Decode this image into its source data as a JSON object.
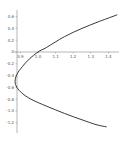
{
  "chart_data": {
    "type": "line",
    "title": "",
    "xlabel": "",
    "ylabel": "",
    "xlim": [
      0.85,
      1.47
    ],
    "ylim": [
      -1.3,
      0.7
    ],
    "grid": false,
    "legend": null,
    "x_ticks": [
      "0.9",
      "1.0",
      "1.1",
      "1.2",
      "1.3",
      "1.4"
    ],
    "y_ticks": [
      "0.6",
      "0.4",
      "0.2",
      "0",
      "-0.2",
      "-0.4",
      "-0.6",
      "-0.8",
      "-1.0",
      "-1.2"
    ],
    "series": [
      {
        "name": "curve",
        "color": "#222222",
        "points": [
          {
            "x": 1.45,
            "y": 0.63
          },
          {
            "x": 1.35,
            "y": 0.52
          },
          {
            "x": 1.25,
            "y": 0.4
          },
          {
            "x": 1.15,
            "y": 0.26
          },
          {
            "x": 1.05,
            "y": 0.08
          },
          {
            "x": 1.0,
            "y": 0.0
          },
          {
            "x": 0.95,
            "y": -0.12
          },
          {
            "x": 0.91,
            "y": -0.25
          },
          {
            "x": 0.88,
            "y": -0.38
          },
          {
            "x": 0.87,
            "y": -0.5
          },
          {
            "x": 0.88,
            "y": -0.6
          },
          {
            "x": 0.91,
            "y": -0.7
          },
          {
            "x": 0.96,
            "y": -0.8
          },
          {
            "x": 1.05,
            "y": -0.92
          },
          {
            "x": 1.15,
            "y": -1.04
          },
          {
            "x": 1.25,
            "y": -1.15
          },
          {
            "x": 1.33,
            "y": -1.23
          },
          {
            "x": 1.39,
            "y": -1.27
          }
        ]
      }
    ]
  }
}
